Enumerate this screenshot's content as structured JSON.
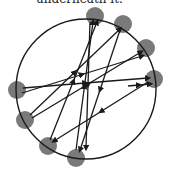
{
  "caption": "underneath it.",
  "colors": {
    "node": "#6b6b6b",
    "edge": "#1a1a1a",
    "circle": "#1a1a1a"
  },
  "circle": {
    "cx": 86,
    "cy": 89,
    "r": 70
  },
  "nodes": [
    {
      "id": 1,
      "x": 95,
      "y": 16
    },
    {
      "id": 2,
      "x": 123,
      "y": 24
    },
    {
      "id": 3,
      "x": 146,
      "y": 48
    },
    {
      "id": 4,
      "x": 154,
      "y": 79
    },
    {
      "id": 5,
      "x": 17,
      "y": 90
    },
    {
      "id": 6,
      "x": 25,
      "y": 120
    },
    {
      "id": 7,
      "x": 48,
      "y": 146
    },
    {
      "id": 8,
      "x": 76,
      "y": 158
    }
  ],
  "edges": [
    {
      "from": 8,
      "to": 1,
      "x1": 76,
      "y1": 150,
      "x2": 93,
      "y2": 22
    },
    {
      "from": 7,
      "to": 1,
      "x1": 50,
      "y1": 140,
      "x2": 97,
      "y2": 22
    },
    {
      "from": 6,
      "to": 2,
      "x1": 30,
      "y1": 115,
      "x2": 120,
      "y2": 29
    },
    {
      "from": 6,
      "to": 3,
      "x1": 32,
      "y1": 118,
      "x2": 141,
      "y2": 52
    },
    {
      "from": 5,
      "to": 4,
      "x1": 23,
      "y1": 88,
      "x2": 148,
      "y2": 78
    },
    {
      "from": 5,
      "to": 3,
      "x1": 22,
      "y1": 93,
      "x2": 142,
      "y2": 56
    },
    {
      "from": 2,
      "to": 8,
      "x1": 120,
      "y1": 30,
      "x2": 80,
      "y2": 150
    },
    {
      "from": 4,
      "to": 7,
      "x1": 148,
      "y1": 82,
      "x2": 54,
      "y2": 141
    },
    {
      "from": 1,
      "to": 8,
      "x1": 90,
      "y1": 22,
      "x2": 86,
      "y2": 148
    },
    {
      "from": 4,
      "to": 4,
      "x1": 128,
      "y1": 86,
      "x2": 150,
      "y2": 84
    }
  ]
}
